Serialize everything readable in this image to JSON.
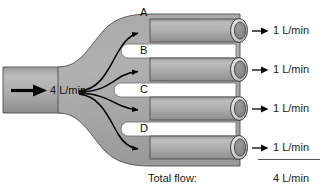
{
  "figure": {
    "type": "flow-branching-diagram",
    "inlet": {
      "label": "4 L/min",
      "arrow_icon": "right-arrow-icon"
    },
    "branches": [
      {
        "letter": "A",
        "outflow": "1 L/min",
        "arrow_icon": "right-arrow-icon"
      },
      {
        "letter": "B",
        "outflow": "1 L/min",
        "arrow_icon": "right-arrow-icon"
      },
      {
        "letter": "C",
        "outflow": "1 L/min",
        "arrow_icon": "right-arrow-icon"
      },
      {
        "letter": "D",
        "outflow": "1 L/min",
        "arrow_icon": "right-arrow-icon"
      }
    ],
    "summary": {
      "label": "Total flow:",
      "value": "4 L/min"
    },
    "colors": {
      "pipe_fill_light": "#b4b4b4",
      "pipe_fill_mid": "#a0a0a0",
      "pipe_fill_dark": "#8c8c8c",
      "pipe_outline": "#4a4a4a",
      "rim_light": "#d8d8d8",
      "bore_dark": "#8a8a8a",
      "arrow_black": "#000000",
      "background": "#ffffff",
      "text": "#1a1a1a"
    }
  }
}
